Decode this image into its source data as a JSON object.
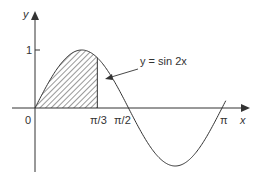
{
  "figure": {
    "curve_label": "y = sin 2x",
    "axis_labels": {
      "x": "x",
      "y": "y"
    },
    "y_ticks": [
      {
        "label": "1",
        "value": 1
      }
    ],
    "x_ticks": [
      {
        "label": "0",
        "value": 0
      },
      {
        "label": "π/3",
        "value": 1.0472
      },
      {
        "label": "π/2",
        "value": 1.5708
      },
      {
        "label": "π",
        "value": 3.1416
      }
    ],
    "shaded_region": {
      "from": "0",
      "to": "π/3",
      "pattern": "diagonal hatching"
    },
    "colors": {
      "stroke": "#333333",
      "background": "#ffffff"
    }
  }
}
